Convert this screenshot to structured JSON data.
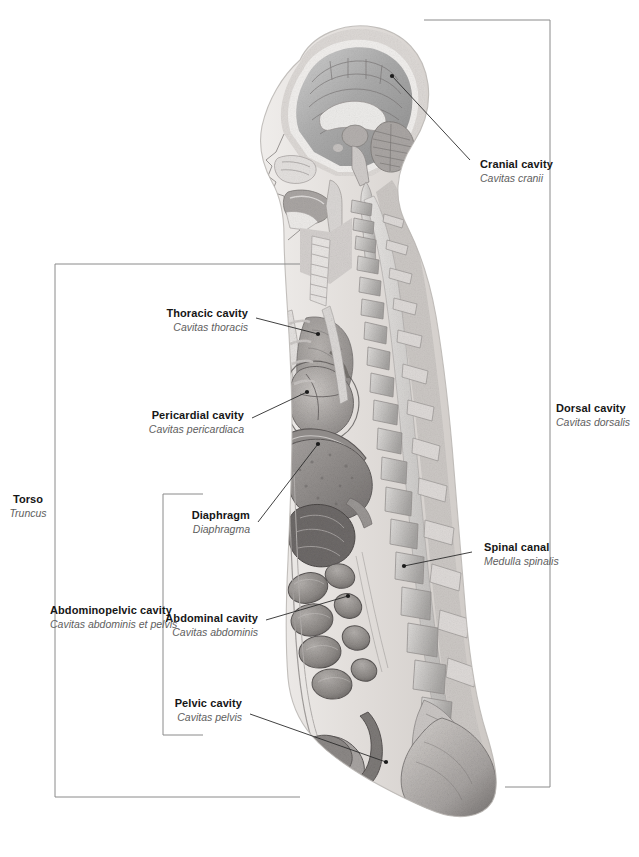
{
  "figure": {
    "illustration_name": "sagittal-body-section",
    "line_color": "#2b2b2b",
    "bracket_color": "#8a8a8a",
    "label_color": "#161616",
    "latin_color": "#5e5e5e",
    "background": "#ffffff"
  },
  "labels": {
    "cranial_cavity": {
      "en": "Cranial cavity",
      "la": "Cavitas cranii"
    },
    "thoracic_cavity": {
      "en": "Thoracic cavity",
      "la": "Cavitas thoracis"
    },
    "pericardial_cavity": {
      "en": "Pericardial cavity",
      "la": "Cavitas pericardiaca"
    },
    "diaphragm": {
      "en": "Diaphragm",
      "la": "Diaphragma"
    },
    "abdominal_cavity": {
      "en": "Abdominal cavity",
      "la": "Cavitas abdominis"
    },
    "pelvic_cavity": {
      "en": "Pelvic cavity",
      "la": "Cavitas pelvis"
    },
    "abdominopelvic_cavity": {
      "en": "Abdominopelvic cavity",
      "la": "Cavitas abdominis et pelvis"
    },
    "torso": {
      "en": "Torso",
      "la": "Truncus"
    },
    "dorsal_cavity": {
      "en": "Dorsal cavity",
      "la": "Cavitas dorsalis"
    },
    "spinal_canal": {
      "en": "Spinal canal",
      "la": "Medulla spinalis"
    }
  }
}
